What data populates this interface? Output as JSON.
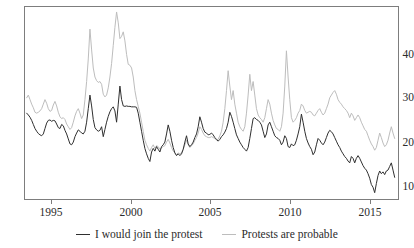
{
  "figure": {
    "clipped_title_fragment": "",
    "background": "#ffffff",
    "frame_color": "#7d7d7d"
  },
  "legend": {
    "position": "bottom-center",
    "entries": [
      {
        "label": "I would join the protest",
        "color": "#2f2f2f",
        "icon": "line-swatch-icon"
      },
      {
        "label": "Protests are probable",
        "color": "#bdbdbd",
        "icon": "line-swatch-icon"
      }
    ]
  },
  "axes": {
    "x_ticks": [
      "1995",
      "2000",
      "2005",
      "2010",
      "2015"
    ],
    "x_tick_values": [
      1995,
      2000,
      2005,
      2010,
      2015
    ],
    "y_ticks": [
      "10",
      "20",
      "30",
      "40"
    ],
    "y_tick_values": [
      10,
      20,
      30,
      40
    ]
  },
  "chart_data": {
    "type": "line",
    "title": "",
    "subtitle": "",
    "xlabel": "",
    "ylabel": "",
    "xlim": [
      1993.9,
      2016.3
    ],
    "ylim": [
      7.0,
      49.5
    ],
    "grid": false,
    "legend_position": "bottom-center",
    "x_tick_labels": [
      "1995",
      "2000",
      "2005",
      "2010",
      "2015"
    ],
    "y_tick_labels": [
      "10",
      "20",
      "30",
      "40"
    ],
    "series": [
      {
        "name": "I would join the protest",
        "color": "#2f2f2f",
        "x": [
          1994.0,
          1994.1,
          1994.2,
          1994.3,
          1994.4,
          1994.5,
          1994.6,
          1994.7,
          1994.8,
          1994.9,
          1995.0,
          1995.1,
          1995.2,
          1995.3,
          1995.4,
          1995.5,
          1995.6,
          1995.7,
          1995.8,
          1995.9,
          1996.0,
          1996.1,
          1996.2,
          1996.3,
          1996.4,
          1996.5,
          1996.6,
          1996.7,
          1996.8,
          1996.9,
          1997.0,
          1997.1,
          1997.2,
          1997.3,
          1997.4,
          1997.5,
          1997.6,
          1997.7,
          1997.8,
          1997.9,
          1998.0,
          1998.1,
          1998.2,
          1998.3,
          1998.4,
          1998.5,
          1998.6,
          1998.7,
          1998.8,
          1998.9,
          1999.0,
          1999.1,
          1999.2,
          1999.3,
          1999.4,
          1999.5,
          1999.6,
          1999.7,
          1999.8,
          1999.9,
          2000.0,
          2000.1,
          2000.2,
          2000.3,
          2000.4,
          2000.5,
          2000.6,
          2000.7,
          2000.8,
          2000.9,
          2001.0,
          2001.1,
          2001.2,
          2001.3,
          2001.4,
          2001.5,
          2001.6,
          2001.7,
          2001.8,
          2001.9,
          2002.0,
          2002.1,
          2002.2,
          2002.3,
          2002.4,
          2002.5,
          2002.6,
          2002.7,
          2002.8,
          2002.9,
          2003.0,
          2003.1,
          2003.2,
          2003.3,
          2003.4,
          2003.5,
          2003.6,
          2003.7,
          2003.8,
          2003.9,
          2004.0,
          2004.1,
          2004.2,
          2004.3,
          2004.4,
          2004.5,
          2004.6,
          2004.7,
          2004.8,
          2004.9,
          2005.0,
          2005.1,
          2005.2,
          2005.3,
          2005.4,
          2005.5,
          2005.6,
          2005.7,
          2005.8,
          2005.9,
          2006.0,
          2006.1,
          2006.2,
          2006.3,
          2006.4,
          2006.5,
          2006.6,
          2006.7,
          2006.8,
          2006.9,
          2007.0,
          2007.1,
          2007.2,
          2007.3,
          2007.4,
          2007.5,
          2007.6,
          2007.7,
          2007.8,
          2007.9,
          2008.0,
          2008.1,
          2008.2,
          2008.3,
          2008.4,
          2008.5,
          2008.6,
          2008.7,
          2008.8,
          2008.9,
          2009.0,
          2009.1,
          2009.2,
          2009.3,
          2009.4,
          2009.5,
          2009.6,
          2009.7,
          2009.8,
          2009.9,
          2010.0,
          2010.1,
          2010.2,
          2010.3,
          2010.4,
          2010.5,
          2010.6,
          2010.7,
          2010.8,
          2010.9,
          2011.0,
          2011.1,
          2011.2,
          2011.3,
          2011.4,
          2011.5,
          2011.6,
          2011.7,
          2011.8,
          2011.9,
          2012.0,
          2012.1,
          2012.2,
          2012.3,
          2012.4,
          2012.5,
          2012.6,
          2012.7,
          2012.8,
          2012.9,
          2013.0,
          2013.1,
          2013.2,
          2013.3,
          2013.4,
          2013.5,
          2013.6,
          2013.7,
          2013.8,
          2013.9,
          2014.0,
          2014.1,
          2014.2,
          2014.3,
          2014.4,
          2014.5,
          2014.6,
          2014.7,
          2014.8,
          2014.9,
          2015.0,
          2015.1,
          2015.2,
          2015.3,
          2015.4,
          2015.5,
          2015.6,
          2015.7,
          2015.8,
          2015.9,
          2016.0,
          2016.1
        ],
        "values": [
          26.0,
          25.6,
          25.1,
          24.4,
          23.5,
          22.6,
          22.0,
          21.5,
          21.2,
          21.0,
          21.4,
          22.6,
          23.8,
          24.4,
          24.5,
          24.2,
          24.4,
          24.3,
          23.6,
          22.8,
          22.6,
          23.5,
          23.2,
          22.2,
          21.4,
          20.3,
          19.2,
          19.0,
          19.6,
          20.8,
          21.6,
          22.3,
          22.0,
          21.6,
          21.4,
          22.0,
          24.0,
          27.0,
          30.0,
          27.6,
          24.6,
          22.8,
          22.3,
          22.0,
          22.2,
          23.0,
          20.8,
          22.4,
          24.0,
          25.3,
          26.3,
          27.0,
          27.4,
          26.5,
          24.0,
          28.0,
          32.0,
          29.0,
          27.6,
          27.5,
          27.6,
          27.5,
          27.5,
          27.4,
          27.4,
          27.4,
          27.3,
          26.0,
          24.0,
          22.0,
          20.0,
          18.2,
          17.0,
          16.0,
          15.3,
          17.4,
          18.2,
          17.6,
          18.6,
          18.0,
          17.4,
          18.6,
          19.0,
          19.6,
          21.4,
          23.4,
          22.0,
          20.0,
          18.4,
          17.2,
          16.6,
          17.0,
          16.6,
          17.0,
          18.0,
          19.6,
          21.0,
          19.2,
          18.6,
          19.0,
          19.6,
          20.6,
          21.4,
          23.0,
          25.2,
          24.0,
          22.6,
          21.8,
          21.6,
          21.2,
          21.3,
          21.6,
          21.2,
          20.6,
          20.2,
          19.8,
          20.2,
          20.8,
          21.2,
          21.8,
          22.6,
          24.0,
          26.2,
          25.3,
          24.0,
          22.6,
          21.2,
          20.4,
          19.6,
          19.0,
          18.4,
          18.0,
          17.6,
          18.4,
          20.4,
          22.6,
          24.8,
          25.0,
          24.6,
          24.4,
          24.0,
          23.4,
          22.0,
          20.6,
          21.4,
          23.4,
          24.0,
          23.0,
          22.0,
          21.0,
          20.6,
          20.4,
          20.0,
          19.0,
          19.6,
          21.0,
          20.4,
          18.6,
          18.4,
          19.2,
          18.8,
          19.0,
          20.0,
          21.4,
          23.0,
          25.8,
          24.0,
          22.0,
          20.4,
          19.4,
          18.6,
          18.0,
          16.8,
          17.4,
          19.0,
          20.4,
          20.0,
          19.4,
          19.0,
          19.6,
          20.6,
          21.6,
          22.2,
          21.9,
          21.4,
          20.6,
          19.8,
          19.0,
          18.4,
          17.6,
          17.0,
          16.4,
          16.0,
          15.4,
          15.0,
          16.4,
          16.0,
          15.0,
          16.0,
          16.6,
          16.0,
          15.2,
          14.4,
          13.8,
          13.4,
          12.6,
          11.6,
          10.2,
          9.6,
          8.4,
          10.4,
          12.2,
          13.2,
          12.6,
          13.0,
          12.4,
          13.2,
          13.4,
          14.2,
          15.0,
          13.4,
          11.8
        ]
      },
      {
        "name": "Protests are probable",
        "color": "#bdbdbd",
        "x": [
          1994.0,
          1994.1,
          1994.2,
          1994.3,
          1994.4,
          1994.5,
          1994.6,
          1994.7,
          1994.8,
          1994.9,
          1995.0,
          1995.1,
          1995.2,
          1995.3,
          1995.4,
          1995.5,
          1995.6,
          1995.7,
          1995.8,
          1995.9,
          1996.0,
          1996.1,
          1996.2,
          1996.3,
          1996.4,
          1996.5,
          1996.6,
          1996.7,
          1996.8,
          1996.9,
          1997.0,
          1997.1,
          1997.2,
          1997.3,
          1997.4,
          1997.5,
          1997.6,
          1997.7,
          1997.8,
          1997.9,
          1998.0,
          1998.1,
          1998.2,
          1998.3,
          1998.4,
          1998.5,
          1998.6,
          1998.7,
          1998.8,
          1998.9,
          1999.0,
          1999.1,
          1999.2,
          1999.3,
          1999.4,
          1999.5,
          1999.6,
          1999.7,
          1999.8,
          1999.9,
          2000.0,
          2000.1,
          2000.2,
          2000.3,
          2000.4,
          2000.5,
          2000.6,
          2000.7,
          2000.8,
          2000.9,
          2001.0,
          2001.1,
          2001.2,
          2001.3,
          2001.4,
          2001.5,
          2001.6,
          2001.7,
          2001.8,
          2001.9,
          2002.0,
          2002.1,
          2002.2,
          2002.3,
          2002.4,
          2002.5,
          2002.6,
          2002.7,
          2002.8,
          2002.9,
          2003.0,
          2003.1,
          2003.2,
          2003.3,
          2003.4,
          2003.5,
          2003.6,
          2003.7,
          2003.8,
          2003.9,
          2004.0,
          2004.1,
          2004.2,
          2004.3,
          2004.4,
          2004.5,
          2004.6,
          2004.7,
          2004.8,
          2004.9,
          2005.0,
          2005.1,
          2005.2,
          2005.3,
          2005.4,
          2005.5,
          2005.6,
          2005.7,
          2005.8,
          2005.9,
          2006.0,
          2006.1,
          2006.2,
          2006.3,
          2006.4,
          2006.5,
          2006.6,
          2006.7,
          2006.8,
          2006.9,
          2007.0,
          2007.1,
          2007.2,
          2007.3,
          2007.4,
          2007.5,
          2007.6,
          2007.7,
          2007.8,
          2007.9,
          2008.0,
          2008.1,
          2008.2,
          2008.3,
          2008.4,
          2008.5,
          2008.6,
          2008.7,
          2008.8,
          2008.9,
          2009.0,
          2009.1,
          2009.2,
          2009.3,
          2009.4,
          2009.5,
          2009.6,
          2009.7,
          2009.8,
          2009.9,
          2010.0,
          2010.1,
          2010.2,
          2010.3,
          2010.4,
          2010.5,
          2010.6,
          2010.7,
          2010.8,
          2010.9,
          2011.0,
          2011.1,
          2011.2,
          2011.3,
          2011.4,
          2011.5,
          2011.6,
          2011.7,
          2011.8,
          2011.9,
          2012.0,
          2012.1,
          2012.2,
          2012.3,
          2012.4,
          2012.5,
          2012.6,
          2012.7,
          2012.8,
          2012.9,
          2013.0,
          2013.1,
          2013.2,
          2013.3,
          2013.4,
          2013.5,
          2013.6,
          2013.7,
          2013.8,
          2013.9,
          2014.0,
          2014.1,
          2014.2,
          2014.3,
          2014.4,
          2014.5,
          2014.6,
          2014.7,
          2014.8,
          2014.9,
          2015.0,
          2015.1,
          2015.2,
          2015.3,
          2015.4,
          2015.5,
          2015.6,
          2015.7,
          2015.8,
          2015.9,
          2016.0,
          2016.1
        ],
        "values": [
          29.4,
          30.0,
          29.0,
          28.0,
          27.2,
          26.2,
          26.0,
          26.2,
          26.5,
          27.0,
          28.0,
          29.0,
          28.2,
          27.0,
          26.4,
          26.6,
          27.8,
          28.6,
          27.6,
          26.2,
          25.2,
          24.8,
          25.0,
          24.6,
          23.6,
          23.0,
          22.4,
          22.8,
          24.0,
          25.4,
          26.4,
          27.0,
          26.0,
          24.8,
          25.6,
          29.0,
          33.0,
          38.0,
          44.6,
          40.0,
          36.0,
          34.0,
          33.2,
          32.8,
          33.0,
          32.4,
          30.2,
          29.6,
          30.0,
          31.6,
          34.0,
          37.0,
          41.0,
          45.0,
          48.4,
          46.0,
          42.5,
          43.0,
          44.0,
          42.0,
          39.0,
          36.8,
          36.6,
          36.0,
          34.0,
          31.0,
          29.0,
          27.5,
          26.0,
          24.0,
          22.0,
          20.0,
          19.0,
          18.2,
          17.6,
          18.4,
          19.0,
          18.2,
          18.8,
          18.6,
          18.0,
          18.4,
          18.6,
          18.8,
          19.6,
          20.2,
          19.4,
          18.4,
          17.6,
          17.2,
          16.8,
          17.2,
          17.0,
          17.2,
          18.0,
          19.0,
          20.0,
          19.0,
          18.4,
          18.8,
          19.2,
          20.0,
          20.6,
          21.6,
          23.0,
          22.4,
          21.6,
          21.0,
          20.8,
          20.6,
          20.6,
          20.8,
          20.6,
          20.4,
          20.0,
          20.2,
          21.0,
          22.0,
          24.0,
          27.0,
          31.0,
          35.4,
          32.0,
          29.0,
          31.0,
          28.0,
          26.0,
          24.0,
          23.0,
          22.4,
          22.0,
          23.0,
          26.0,
          30.0,
          34.6,
          31.0,
          33.0,
          30.0,
          27.0,
          25.6,
          25.0,
          24.6,
          24.0,
          25.0,
          27.0,
          29.0,
          28.0,
          26.0,
          24.4,
          23.4,
          22.6,
          22.4,
          22.0,
          23.0,
          26.0,
          32.0,
          39.8,
          34.0,
          29.0,
          25.0,
          24.0,
          24.4,
          25.0,
          26.0,
          26.6,
          28.0,
          27.6,
          26.6,
          26.0,
          26.2,
          26.4,
          26.2,
          25.6,
          25.4,
          26.0,
          26.6,
          27.0,
          26.2,
          25.6,
          26.0,
          27.0,
          28.0,
          29.4,
          30.0,
          30.6,
          31.0,
          30.2,
          29.0,
          28.4,
          28.0,
          27.4,
          27.0,
          26.6,
          26.0,
          25.0,
          26.0,
          25.4,
          24.4,
          25.0,
          25.6,
          25.0,
          24.0,
          23.2,
          22.4,
          22.0,
          21.0,
          20.0,
          19.2,
          18.6,
          17.8,
          18.4,
          20.0,
          21.6,
          20.6,
          19.4,
          18.6,
          19.0,
          20.0,
          21.6,
          23.0,
          21.6,
          20.4
        ]
      }
    ]
  }
}
